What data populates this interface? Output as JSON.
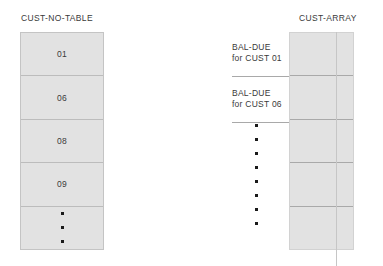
{
  "diagram": {
    "left_table": {
      "title": "CUST-NO-TABLE",
      "cells": [
        {
          "type": "text",
          "value": "01"
        },
        {
          "type": "text",
          "value": "06"
        },
        {
          "type": "text",
          "value": "08"
        },
        {
          "type": "text",
          "value": "09"
        },
        {
          "type": "ellipsis",
          "value": "",
          "dot_count": 3
        }
      ]
    },
    "right_array": {
      "title": "CUST-ARRAY",
      "cell_count": 5
    },
    "annotations": [
      {
        "line1": "BAL-DUE",
        "line2": "for CUST 01"
      },
      {
        "line1": "BAL-DUE",
        "line2": "for CUST 06"
      }
    ],
    "middle_ellipsis": {
      "dot_count": 8
    },
    "colors": {
      "cell_fill": "#e2e2e2",
      "cell_border": "#bcbcbc",
      "box_border": "#c4c4c4",
      "text": "#3a3a3a",
      "dot": "#1a1a1a",
      "rule": "#a9a9a9",
      "background": "#ffffff"
    }
  }
}
